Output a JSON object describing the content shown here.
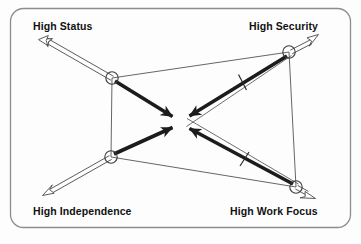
{
  "diagram": {
    "type": "force-field-diagram",
    "frame": {
      "shape": "rounded-rectangle",
      "border_color": "#8d8d8d",
      "fill_color": "#fdfdfd",
      "x": 10,
      "y": 8,
      "width": 341,
      "height": 220,
      "radius": 13
    },
    "center": {
      "x": 180,
      "y": 122,
      "label": ""
    },
    "colors": {
      "thick_arrow": "#1c1c1c",
      "thin_line": "#4a4a4a",
      "hollow_arrow_stroke": "#4a4a4a",
      "hollow_arrow_fill": "#ffffff",
      "node_circle_stroke": "#3a3a3a",
      "text": "#111111"
    },
    "nodes": [
      {
        "id": "high-status",
        "label": "High Status",
        "circle": {
          "x": 112,
          "y": 78,
          "r": 6.5
        },
        "outward_arrow_tip": {
          "x": 42,
          "y": 38
        },
        "label_position": "above-left"
      },
      {
        "id": "high-security",
        "label": "High Security",
        "circle": {
          "x": 289,
          "y": 52,
          "r": 6.5
        },
        "outward_arrow_tip": {
          "x": 318,
          "y": 37
        },
        "label_position": "above-right"
      },
      {
        "id": "high-independence",
        "label": "High Independence",
        "circle": {
          "x": 111,
          "y": 157,
          "r": 6.5
        },
        "outward_arrow_tip": {
          "x": 43,
          "y": 195
        },
        "label_position": "below-left"
      },
      {
        "id": "high-work-focus",
        "label": "High Work Focus",
        "circle": {
          "x": 296,
          "y": 187,
          "r": 6.5
        },
        "outward_arrow_tip": {
          "x": 315,
          "y": 198
        },
        "label_position": "below-right"
      }
    ],
    "perimeter_edges": [
      {
        "id": "edge-status-security",
        "from": "high-status",
        "to": "high-security"
      },
      {
        "id": "edge-status-independence",
        "from": "high-status",
        "to": "high-independence"
      },
      {
        "id": "edge-security-work-focus",
        "from": "high-security",
        "to": "high-work-focus"
      },
      {
        "id": "edge-independence-work-focus",
        "from": "high-independence",
        "to": "high-work-focus"
      }
    ],
    "converging_arrows": [
      {
        "id": "arrow-status-to-center",
        "from": "high-status",
        "to": "center",
        "tick": false
      },
      {
        "id": "arrow-security-to-center",
        "from": "high-security",
        "to": "center",
        "tick": true,
        "tick_at": {
          "x": 243,
          "y": 82
        }
      },
      {
        "id": "arrow-independence-to-center",
        "from": "high-independence",
        "to": "center",
        "tick": false
      },
      {
        "id": "arrow-work-focus-to-center",
        "from": "high-work-focus",
        "to": "center",
        "tick": true,
        "tick_at": {
          "x": 245,
          "y": 159
        }
      }
    ]
  }
}
